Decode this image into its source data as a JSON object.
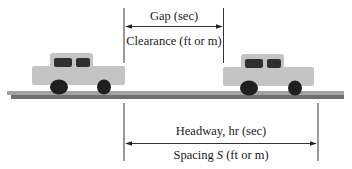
{
  "diagram": {
    "type": "vehicle spacing / headway illustration",
    "colors": {
      "car_body": "#c4c4c4",
      "car_window": "#2f2f2f",
      "wheel": "#1f1f1f",
      "road_top": "#9a9a9a",
      "road_bottom": "#6e6e6e",
      "line": "#333333"
    },
    "vehicles": [
      {
        "name": "following-car",
        "position": "left"
      },
      {
        "name": "leading-car",
        "position": "right"
      }
    ],
    "upper_dimension": {
      "top_label": "Gap (sec)",
      "bottom_label": "Clearance (ft or m)"
    },
    "lower_dimension": {
      "top_label": "Headway, hr (sec)",
      "bottom_label_prefix": "Spacing ",
      "bottom_label_symbol": "S",
      "bottom_label_suffix": " (ft or m)"
    }
  }
}
